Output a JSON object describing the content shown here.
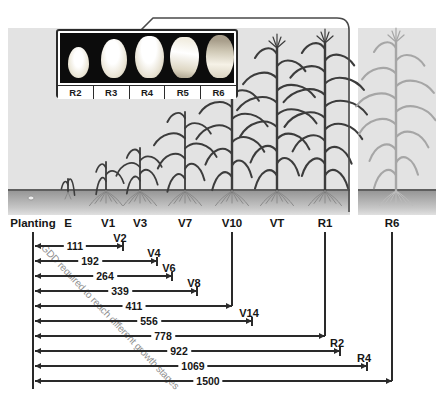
{
  "figure": {
    "title_hint": "Corn growth stages with GDD timeline",
    "kernel_panel": {
      "labels": [
        "R2",
        "R3",
        "R4",
        "R5",
        "R6"
      ]
    }
  },
  "timeline": {
    "header_stages": [
      "Planting",
      "E",
      "V1",
      "V3",
      "V7",
      "V10",
      "VT",
      "R1",
      "R6"
    ],
    "caption": "GDD required to reach different growth stages",
    "rows": [
      {
        "gdd": "111",
        "stage": "V2"
      },
      {
        "gdd": "192",
        "stage": "V4"
      },
      {
        "gdd": "264",
        "stage": "V6"
      },
      {
        "gdd": "339",
        "stage": "V8"
      },
      {
        "gdd": "411",
        "stage": "V10"
      },
      {
        "gdd": "556",
        "stage": "V14"
      },
      {
        "gdd": "778",
        "stage": "R1"
      },
      {
        "gdd": "922",
        "stage": "R2"
      },
      {
        "gdd": "1069",
        "stage": "R4"
      },
      {
        "gdd": "1500",
        "stage": "R6"
      }
    ]
  },
  "chart_data": {
    "type": "table",
    "title": "GDD required to reach different growth stages",
    "categories": [
      "V2",
      "V4",
      "V6",
      "V8",
      "V10",
      "V14",
      "R1",
      "R2",
      "R4",
      "R6"
    ],
    "values": [
      111,
      192,
      264,
      339,
      411,
      556,
      778,
      922,
      1069,
      1500
    ],
    "xlabel": "growth stage",
    "ylabel": "GDD"
  },
  "colors": {
    "line": "#2a2a2a",
    "caption_gray": "#8f8f8f",
    "panel_bg": "#e3e3e3",
    "soil_dark": "#979797",
    "inset_bg": "#0c0c0c",
    "faded_plant": "#a6a6a6"
  }
}
